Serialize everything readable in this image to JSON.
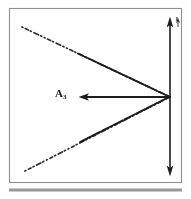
{
  "figure": {
    "labels": {
      "vector_label_base": "A",
      "vector_label_subscript": "3",
      "axis_tick_label": "1"
    },
    "colors": {
      "ink": "#1a1a1a",
      "frame": "#8f8f8f",
      "rule": "#9a9a9a",
      "background": "#ffffff",
      "dashed_line": "#2a2a2a"
    },
    "geometry": {
      "frame": {
        "x": 9,
        "y": 8,
        "width": 173,
        "height": 175
      },
      "bottom_rule": {
        "x1": 9,
        "y1": 190,
        "x2": 182,
        "y2": 190,
        "thickness": 3
      },
      "vertex": {
        "x": 170,
        "y": 97
      },
      "vertical_arrow": {
        "x": 170,
        "y_top": 17,
        "y_bottom": 176
      },
      "horizontal_arrow": {
        "x_tail": 170,
        "x_head": 79,
        "y": 97
      },
      "upper_dashed_line": {
        "x1": 22,
        "y1": 27,
        "x2": 170,
        "y2": 97
      },
      "lower_dashed_line": {
        "x1": 25,
        "y1": 171,
        "x2": 170,
        "y2": 97
      }
    }
  }
}
